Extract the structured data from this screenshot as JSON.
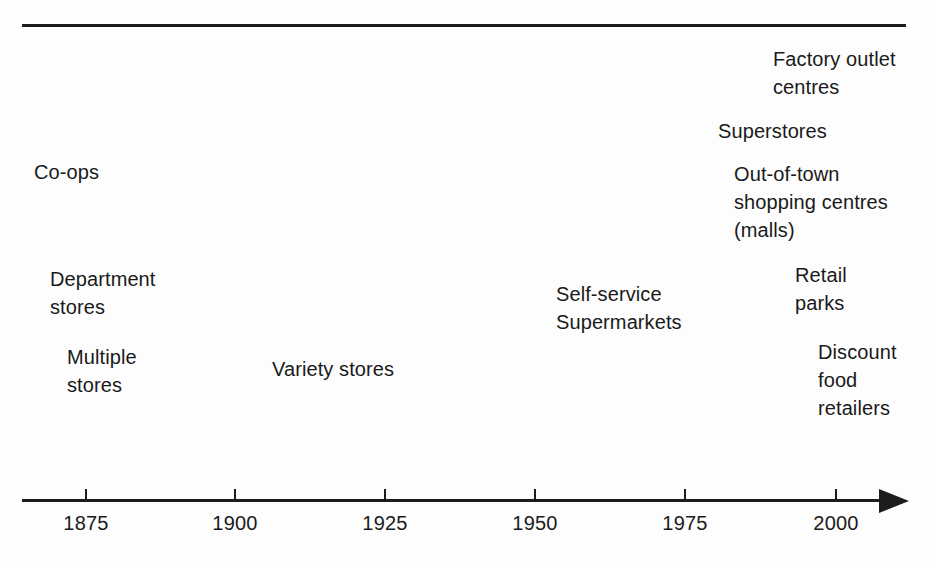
{
  "figure": {
    "type": "timeline",
    "title": "",
    "background_color": "#fdfdfd",
    "line_color": "#1c1c1c",
    "text_color": "#1a1a1a"
  },
  "axis": {
    "label": "",
    "arrow_direction": "right",
    "range": [
      1860,
      2012
    ],
    "ticks": [
      {
        "label": "1875",
        "value": 1875,
        "x": 85
      },
      {
        "label": "1900",
        "value": 1900,
        "x": 234
      },
      {
        "label": "1925",
        "value": 1925,
        "x": 384
      },
      {
        "label": "1950",
        "value": 1950,
        "x": 534
      },
      {
        "label": "1975",
        "value": 1975,
        "x": 684
      },
      {
        "label": "2000",
        "value": 2000,
        "x": 835
      }
    ]
  },
  "events": [
    {
      "name": "co-ops",
      "text": "Co-ops",
      "x": 34,
      "y": 158,
      "approx_year": 1868
    },
    {
      "name": "department-stores",
      "text": "Department\nstores",
      "x": 50,
      "y": 265,
      "approx_year": 1871
    },
    {
      "name": "multiple-stores",
      "text": "Multiple\nstores",
      "x": 67,
      "y": 343,
      "approx_year": 1874
    },
    {
      "name": "variety-stores",
      "text": "Variety stores",
      "x": 272,
      "y": 355,
      "approx_year": 1908
    },
    {
      "name": "self-service-supermarkets",
      "text": "Self-service\nSupermarkets",
      "x": 556,
      "y": 280,
      "approx_year": 1954
    },
    {
      "name": "superstores",
      "text": "Superstores",
      "x": 718,
      "y": 117,
      "approx_year": 1980
    },
    {
      "name": "out-of-town-shopping-centres",
      "text": "Out-of-town\nshopping centres\n(malls)",
      "x": 734,
      "y": 160,
      "approx_year": 1983
    },
    {
      "name": "retail-parks",
      "text": "Retail\nparks",
      "x": 795,
      "y": 261,
      "approx_year": 1987
    },
    {
      "name": "factory-outlet-centres",
      "text": "Factory outlet\ncentres",
      "x": 773,
      "y": 45,
      "approx_year": 1985
    },
    {
      "name": "discount-food-retailers",
      "text": "Discount\nfood\nretailers",
      "x": 818,
      "y": 338,
      "approx_year": 1990
    }
  ]
}
